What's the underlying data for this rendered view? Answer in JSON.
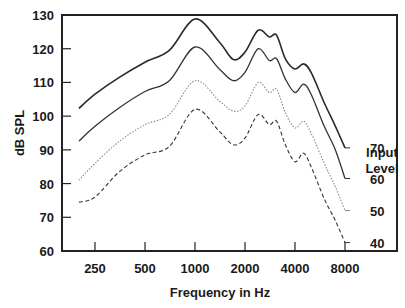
{
  "chart_data": {
    "type": "line",
    "title": "",
    "xlabel": "Frequency in Hz",
    "ylabel": "dB SPL",
    "xscale": "log2",
    "xlim": [
      200,
      10000
    ],
    "ylim": [
      60,
      130
    ],
    "grid": false,
    "x_ticks": [
      250,
      500,
      1000,
      2000,
      4000,
      8000
    ],
    "x_tick_labels": [
      "250",
      "500",
      "1000",
      "2000",
      "4000",
      "8000"
    ],
    "y_ticks": [
      60,
      70,
      80,
      90,
      100,
      110,
      120,
      130
    ],
    "y_tick_labels": [
      "60",
      "70",
      "80",
      "90",
      "100",
      "110",
      "120",
      "130"
    ],
    "legend_title": "Input Level",
    "legend_position": "right, labels at curve ends",
    "x": [
      200,
      250,
      350,
      500,
      700,
      1000,
      1400,
      1700,
      2000,
      2400,
      2800,
      3100,
      3500,
      4000,
      4500,
      5000,
      6000,
      7000,
      8000
    ],
    "series": [
      {
        "name": "70",
        "style": "solid-dark",
        "values": [
          102.3,
          106.5,
          111.5,
          116,
          119.5,
          128.8,
          122,
          116.8,
          119,
          125.5,
          123.5,
          124,
          117,
          114,
          115.5,
          113,
          104,
          97,
          90.6
        ]
      },
      {
        "name": "60",
        "style": "solid",
        "values": [
          92.6,
          97,
          102.5,
          107.3,
          110.5,
          120.5,
          114,
          110.5,
          113,
          120,
          116.5,
          117,
          111,
          107,
          109.5,
          106.5,
          97,
          90,
          81.5
        ]
      },
      {
        "name": "50",
        "style": "dotted-light",
        "values": [
          81,
          86,
          92.5,
          97.5,
          100.5,
          110.5,
          104.5,
          101.5,
          103,
          110,
          107,
          108,
          101,
          96.5,
          98.5,
          95,
          86,
          79,
          72
        ]
      },
      {
        "name": "40",
        "style": "dashed",
        "values": [
          74.5,
          76,
          83.5,
          88.5,
          91,
          102,
          95.5,
          91.5,
          93.5,
          100.5,
          97.5,
          98.5,
          91.5,
          86.5,
          89,
          85,
          75.5,
          69,
          62.5
        ]
      }
    ]
  },
  "labels": {
    "ylabel": "dB SPL",
    "xlabel": "Frequency in Hz",
    "legend_title_line1": "Input",
    "legend_title_line2": "Level",
    "series_labels": [
      "70",
      "60",
      "50",
      "40"
    ]
  }
}
